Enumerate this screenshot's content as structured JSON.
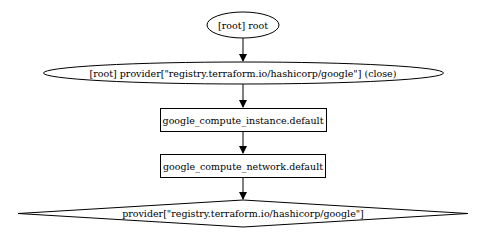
{
  "diagram": {
    "type": "graphviz-dependency-graph",
    "nodes": [
      {
        "id": "root",
        "label": "[root] root",
        "shape": "ellipse"
      },
      {
        "id": "provider_close",
        "label": "[root] provider[\"registry.terraform.io/hashicorp/google\"] (close)",
        "shape": "ellipse"
      },
      {
        "id": "instance",
        "label": "google_compute_instance.default",
        "shape": "box"
      },
      {
        "id": "network",
        "label": "google_compute_network.default",
        "shape": "box"
      },
      {
        "id": "provider",
        "label": "provider[\"registry.terraform.io/hashicorp/google\"]",
        "shape": "diamond"
      }
    ],
    "edges": [
      {
        "from": "root",
        "to": "provider_close"
      },
      {
        "from": "provider_close",
        "to": "instance"
      },
      {
        "from": "instance",
        "to": "network"
      },
      {
        "from": "network",
        "to": "provider"
      }
    ],
    "colors": {
      "stroke": "#000000",
      "fill": "#ffffff",
      "text": "#000000"
    }
  }
}
